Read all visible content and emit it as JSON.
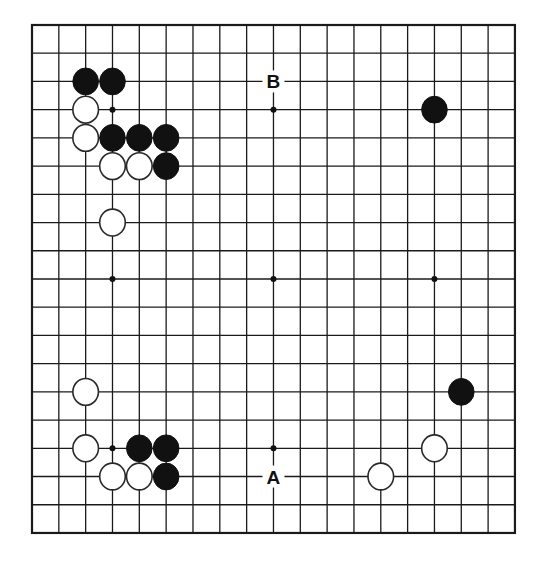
{
  "board": {
    "size": 19,
    "origin_px": {
      "x": 32,
      "y": 25
    },
    "spacing_px": {
      "x": 26.83,
      "y": 28.22
    },
    "star_points": [
      [
        3,
        3
      ],
      [
        9,
        3
      ],
      [
        15,
        3
      ],
      [
        3,
        9
      ],
      [
        9,
        9
      ],
      [
        15,
        9
      ],
      [
        3,
        15
      ],
      [
        9,
        15
      ],
      [
        15,
        15
      ]
    ],
    "stones": [
      {
        "color": "black",
        "col": 2,
        "row": 2
      },
      {
        "color": "black",
        "col": 3,
        "row": 2
      },
      {
        "color": "white",
        "col": 2,
        "row": 3
      },
      {
        "color": "white",
        "col": 2,
        "row": 4
      },
      {
        "color": "black",
        "col": 3,
        "row": 4
      },
      {
        "color": "black",
        "col": 4,
        "row": 4
      },
      {
        "color": "black",
        "col": 5,
        "row": 4
      },
      {
        "color": "white",
        "col": 3,
        "row": 5
      },
      {
        "color": "white",
        "col": 4,
        "row": 5
      },
      {
        "color": "black",
        "col": 5,
        "row": 5
      },
      {
        "color": "white",
        "col": 3,
        "row": 7
      },
      {
        "color": "black",
        "col": 15,
        "row": 3
      },
      {
        "color": "white",
        "col": 2,
        "row": 13
      },
      {
        "color": "black",
        "col": 16,
        "row": 13
      },
      {
        "color": "white",
        "col": 2,
        "row": 15
      },
      {
        "color": "black",
        "col": 4,
        "row": 15
      },
      {
        "color": "black",
        "col": 5,
        "row": 15
      },
      {
        "color": "white",
        "col": 15,
        "row": 15
      },
      {
        "color": "white",
        "col": 3,
        "row": 16
      },
      {
        "color": "white",
        "col": 4,
        "row": 16
      },
      {
        "color": "black",
        "col": 5,
        "row": 16
      },
      {
        "color": "white",
        "col": 13,
        "row": 16
      }
    ],
    "labels": [
      {
        "text": "B",
        "col": 9,
        "row": 2
      },
      {
        "text": "A",
        "col": 9,
        "row": 16
      }
    ]
  },
  "colors": {
    "line": "#1a1a1a",
    "black_stone": "#111111",
    "white_stone": "#ffffff",
    "background": "#ffffff"
  }
}
